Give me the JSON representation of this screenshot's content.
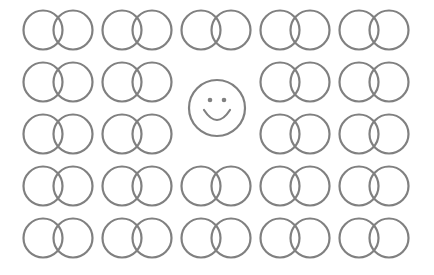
{
  "canvas": {
    "width": 434,
    "height": 275,
    "background": "#ffffff"
  },
  "style": {
    "stroke": "#808080",
    "stroke_width": 2.2
  },
  "grid": {
    "rows": 5,
    "cols": 5,
    "row_centers_y": [
      30,
      82,
      134,
      186,
      238
    ],
    "pair_left_centers_x": [
      43,
      122,
      201,
      280,
      359
    ],
    "pair_offset_x": 30,
    "radius": 19.5,
    "empty_cells": [
      [
        1,
        2
      ],
      [
        2,
        2
      ]
    ]
  },
  "smiley": {
    "cx": 217,
    "cy": 108,
    "r": 28,
    "eye_dx": 7,
    "eye_dy": -8,
    "eye_r": 2.3
  }
}
